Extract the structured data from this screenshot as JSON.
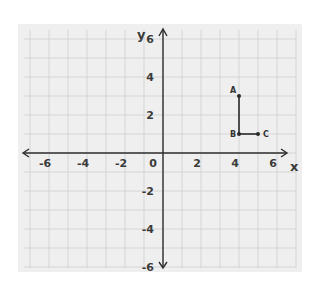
{
  "chart_data": {
    "type": "scatter",
    "title": "",
    "xlabel": "x",
    "ylabel": "y",
    "xlim": [
      -6,
      6
    ],
    "ylim": [
      -6,
      6
    ],
    "grid": true,
    "x_ticks": [
      -6,
      -4,
      -2,
      0,
      2,
      4,
      6
    ],
    "y_ticks": [
      -6,
      -4,
      -2,
      2,
      4,
      6
    ],
    "points": [
      {
        "label": "A",
        "x": 4,
        "y": 3
      },
      {
        "label": "B",
        "x": 4,
        "y": 1
      },
      {
        "label": "C",
        "x": 5,
        "y": 1
      }
    ],
    "segments": [
      {
        "from": "A",
        "to": "B"
      },
      {
        "from": "B",
        "to": "C"
      }
    ],
    "legend": null
  },
  "colors": {
    "background": "#efefef",
    "grid": "#cfcfcf",
    "axis": "#2e2e2e",
    "point": "#2a2a2a"
  }
}
